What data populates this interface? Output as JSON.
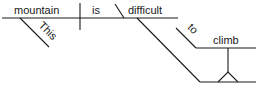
{
  "diagram": {
    "type": "sentence-diagram",
    "sentence": "This mountain is difficult to climb",
    "words": {
      "subject": "mountain",
      "verb": "is",
      "predicate_adjective": "difficult",
      "modifier": "This",
      "infinitive_marker": "to",
      "infinitive_verb": "climb"
    },
    "colors": {
      "ink": "#1a1a1a",
      "background": "#ffffff"
    }
  }
}
